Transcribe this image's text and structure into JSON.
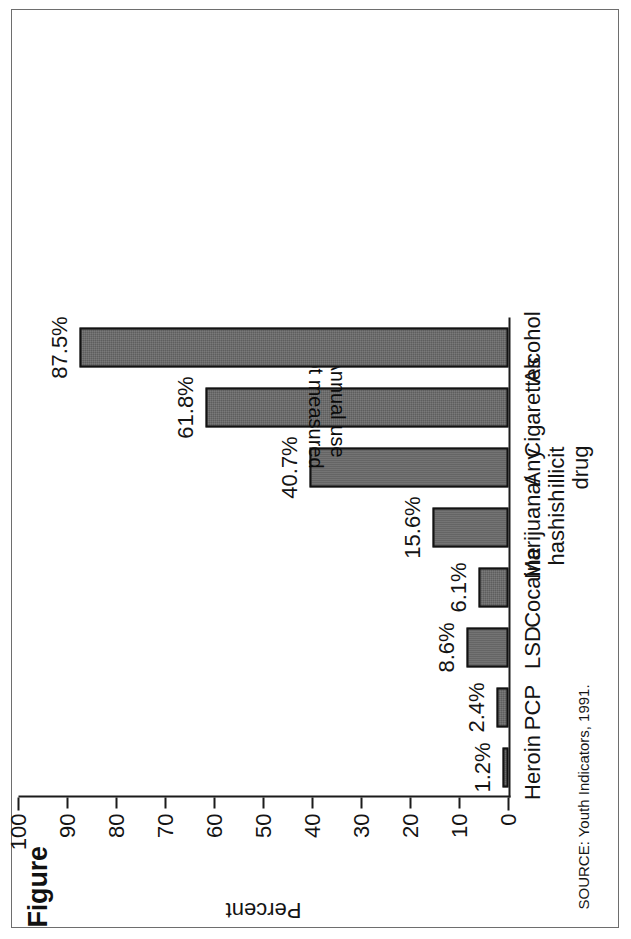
{
  "figure": {
    "title": "Figure",
    "source_note": "SOURCE: Youth Indicators, 1991."
  },
  "chart_data": {
    "type": "bar",
    "orientation": "vertical",
    "title": "Figure",
    "xlabel": "",
    "ylabel": "Percent",
    "ylim": [
      0,
      100
    ],
    "ytick_labels": [
      "0",
      "10",
      "20",
      "30",
      "40",
      "50",
      "60",
      "70",
      "80",
      "90",
      "100"
    ],
    "ytick_values": [
      0,
      10,
      20,
      30,
      40,
      50,
      60,
      70,
      80,
      90,
      100
    ],
    "grid": false,
    "legend": null,
    "categories": [
      "Heroin",
      "PCP",
      "LSD",
      "Cocaine",
      "Marijuana/\nhashish",
      "Any\nillicit\ndrug",
      "Cigarettes",
      "Alcohol"
    ],
    "values": [
      1.2,
      2.4,
      8.6,
      6.1,
      15.6,
      40.7,
      61.8,
      87.5
    ],
    "data_labels": [
      "1.2%",
      "2.4%",
      "8.6%",
      "6.1%",
      "15.6%",
      "40.7%",
      "61.8%",
      "87.5%"
    ],
    "annotations": [
      {
        "category": "Cigarettes",
        "text": "Annual use\nnot measured",
        "rotated_180": true
      }
    ],
    "bar_fill_color": "#5e5e5e",
    "bar_edge_color": "#121212",
    "source": "SOURCE: Youth Indicators, 1991."
  }
}
